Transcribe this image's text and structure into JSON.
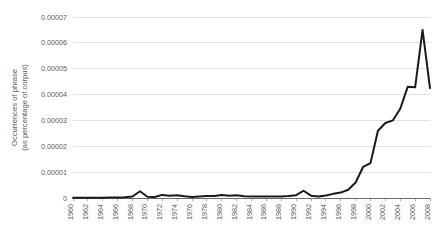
{
  "chart_data": {
    "type": "line",
    "title": "",
    "xlabel": "",
    "ylabel": "Occurrences of phrase\n(as percentage of corpus)",
    "ylabel_line1": "Occurrences of phrase",
    "ylabel_line2": "(as percentage of corpus)",
    "xlim": [
      1960,
      2008
    ],
    "ylim": [
      0,
      7e-05
    ],
    "grid": true,
    "legend": false,
    "legend_position": "none",
    "line_color": "#1a1a1a",
    "gridline_color": "#d9d9d9",
    "axis_color": "#6b6b6b",
    "background_color": "#ffffff",
    "ytick_labels": [
      "0.00007",
      "0.00006",
      "0.00005",
      "0.00004",
      "0.00003",
      "0.00002",
      "0.00001",
      "0"
    ],
    "ytick_values": [
      7e-05,
      6e-05,
      5e-05,
      4e-05,
      3e-05,
      2e-05,
      1e-05,
      0
    ],
    "xtick_labels": [
      "1960",
      "1962",
      "1964",
      "1966",
      "1968",
      "1970",
      "1972",
      "1974",
      "1976",
      "1978",
      "1980",
      "1982",
      "1984",
      "1986",
      "1988",
      "1990",
      "1992",
      "1994",
      "1996",
      "1998",
      "2000",
      "2002",
      "2004",
      "2006",
      "2008"
    ],
    "xtick_values": [
      1960,
      1962,
      1964,
      1966,
      1968,
      1970,
      1972,
      1974,
      1976,
      1978,
      1980,
      1982,
      1984,
      1986,
      1988,
      1990,
      1992,
      1994,
      1996,
      1998,
      2000,
      2002,
      2004,
      2006,
      2008
    ],
    "xtick_rotation": 90,
    "x": [
      1960,
      1961,
      1962,
      1963,
      1964,
      1965,
      1966,
      1967,
      1968,
      1969,
      1970,
      1971,
      1972,
      1973,
      1974,
      1975,
      1976,
      1977,
      1978,
      1979,
      1980,
      1981,
      1982,
      1983,
      1984,
      1985,
      1986,
      1987,
      1988,
      1989,
      1990,
      1991,
      1992,
      1993,
      1994,
      1995,
      1996,
      1997,
      1998,
      1999,
      2000,
      2001,
      2002,
      2003,
      2004,
      2005,
      2006,
      2007,
      2008
    ],
    "values": [
      1e-07,
      1e-07,
      1e-07,
      1e-07,
      1e-07,
      2e-07,
      2e-07,
      3e-07,
      6e-07,
      2.6e-06,
      5e-07,
      4e-07,
      1.2e-06,
      9e-07,
      1.1e-06,
      7e-07,
      4e-07,
      6e-07,
      8e-07,
      8e-07,
      1.2e-06,
      9e-07,
      1.1e-06,
      7e-07,
      6e-07,
      6e-07,
      6e-07,
      6e-07,
      6e-07,
      8e-07,
      1.1e-06,
      2.8e-06,
      9e-07,
      6e-07,
      1e-06,
      1.6e-06,
      2.1e-06,
      3.2e-06,
      6e-06,
      1.2e-05,
      1.35e-05,
      2.6e-05,
      2.9e-05,
      3e-05,
      3.45e-05,
      4.3e-05,
      4.28e-05,
      6.5e-05,
      4.25e-05
    ],
    "series": [
      {
        "name": "Occurrences of phrase",
        "values": [
          1e-07,
          1e-07,
          1e-07,
          1e-07,
          1e-07,
          2e-07,
          2e-07,
          3e-07,
          6e-07,
          2.6e-06,
          5e-07,
          4e-07,
          1.2e-06,
          9e-07,
          1.1e-06,
          7e-07,
          4e-07,
          6e-07,
          8e-07,
          8e-07,
          1.2e-06,
          9e-07,
          1.1e-06,
          7e-07,
          6e-07,
          6e-07,
          6e-07,
          6e-07,
          6e-07,
          8e-07,
          1.1e-06,
          2.8e-06,
          9e-07,
          6e-07,
          1e-06,
          1.6e-06,
          2.1e-06,
          3.2e-06,
          6e-06,
          1.2e-05,
          1.35e-05,
          2.6e-05,
          2.9e-05,
          3e-05,
          3.45e-05,
          4.3e-05,
          4.28e-05,
          6.5e-05,
          4.25e-05
        ]
      }
    ],
    "annotations": []
  }
}
